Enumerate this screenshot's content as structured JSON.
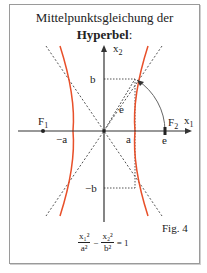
{
  "title": {
    "line1": "Mittelpunktsgleichung der",
    "line2": "Hyperbel",
    "colon": ":"
  },
  "axes": {
    "x_label": "x",
    "x_sub": "1",
    "y_label": "x",
    "y_sub": "2"
  },
  "labels": {
    "b": "b",
    "minus_b": "−b",
    "a": "a",
    "minus_a": "−a",
    "e_axis": "e",
    "e_diag": "e",
    "f1": "F",
    "f1_sub": "1",
    "f2": "F",
    "f2_sub": "2"
  },
  "figure_label": "Fig. 4",
  "formula": {
    "t1_num": "x₁²",
    "t1_den": "a²",
    "minus": "−",
    "t2_num": "x₂²",
    "t2_den": "b²",
    "equals": "= 1"
  },
  "colors": {
    "curve": "#e8502a",
    "axis": "#333333",
    "dashed": "#555555",
    "frame": "#9a9a9a"
  }
}
